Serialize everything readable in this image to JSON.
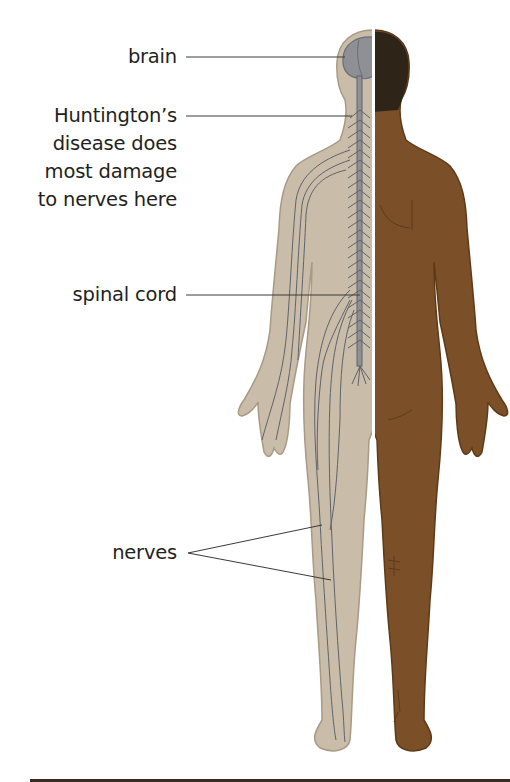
{
  "diagram": {
    "labels": [
      {
        "id": "brain",
        "text": "brain"
      },
      {
        "id": "huntington",
        "lines": [
          "Huntington’s",
          "disease does",
          "most damage",
          "to nerves here"
        ]
      },
      {
        "id": "spinal",
        "text": "spinal cord"
      },
      {
        "id": "nerves",
        "text": "nerves"
      }
    ],
    "colors": {
      "nerve_side_skin": "#c9bca8",
      "nerve_side_outline": "#a89a84",
      "skin_side": "#7b5028",
      "skin_side_outline": "#5e3a18",
      "hair": "#2e2518",
      "brain": "#8f9096",
      "nerve_line": "#5f636d",
      "leader_line": "#3a3a3a",
      "text": "#231f20",
      "divider": "#ffffff"
    }
  }
}
